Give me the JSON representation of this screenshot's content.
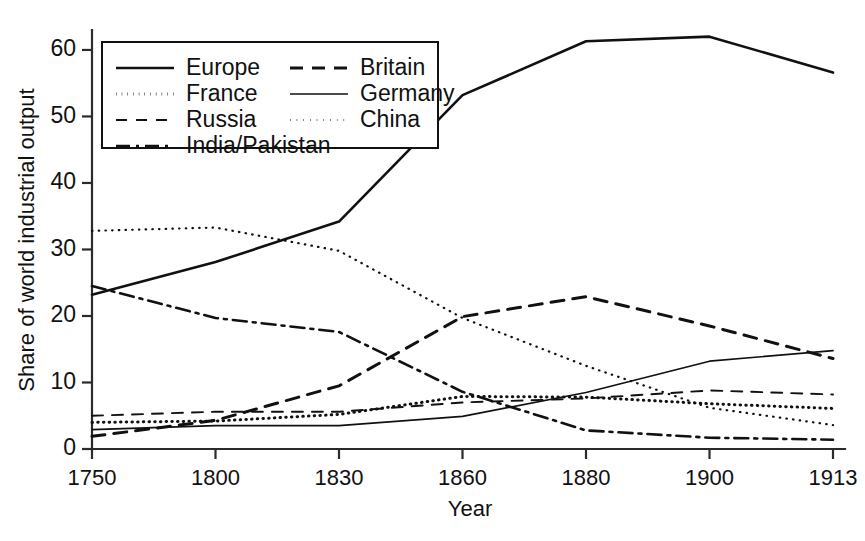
{
  "chart_data": {
    "type": "line",
    "title": "",
    "xlabel": "Year",
    "ylabel": "Share of world industrial output",
    "x": [
      "1750",
      "1800",
      "1830",
      "1860",
      "1880",
      "1900",
      "1913"
    ],
    "categories": [
      "1750",
      "1800",
      "1830",
      "1860",
      "1880",
      "1900",
      "1913"
    ],
    "xtick_labels": [
      "1750",
      "1800",
      "1830",
      "1860",
      "1880",
      "1900",
      "1913"
    ],
    "ytick_labels": [
      "0",
      "10",
      "20",
      "30",
      "40",
      "50",
      "60"
    ],
    "yticks": [
      0,
      10,
      20,
      30,
      40,
      50,
      60
    ],
    "ylim": [
      0,
      63
    ],
    "grid": false,
    "legend_position": "top-left",
    "legend_entries": [
      "Europe",
      "Britain",
      "France",
      "Germany",
      "Russia",
      "China",
      "India/Pakistan"
    ],
    "series": [
      {
        "name": "Europe",
        "style": "solid",
        "values": [
          23.2,
          28.1,
          34.2,
          53.2,
          61.3,
          62.0,
          56.6
        ]
      },
      {
        "name": "Britain",
        "style": "dashed",
        "values": [
          1.9,
          4.3,
          9.5,
          19.9,
          22.9,
          18.5,
          13.6
        ]
      },
      {
        "name": "France",
        "style": "dotted",
        "values": [
          4.0,
          4.2,
          5.2,
          7.9,
          7.8,
          6.8,
          6.1
        ]
      },
      {
        "name": "Germany",
        "style": "solid-thin",
        "values": [
          2.9,
          3.5,
          3.5,
          4.9,
          8.5,
          13.2,
          14.8
        ]
      },
      {
        "name": "Russia",
        "style": "dashed-thin",
        "values": [
          5.0,
          5.6,
          5.6,
          7.0,
          7.6,
          8.8,
          8.2
        ]
      },
      {
        "name": "China",
        "style": "dotted-thin",
        "values": [
          32.8,
          33.3,
          29.8,
          19.7,
          12.5,
          6.2,
          3.6
        ]
      },
      {
        "name": "India/Pakistan",
        "style": "dashdot",
        "values": [
          24.5,
          19.7,
          17.6,
          8.6,
          2.8,
          1.7,
          1.4
        ]
      }
    ]
  },
  "legend": {
    "column_left": [
      {
        "label": "Europe",
        "swatch": "solid"
      },
      {
        "label": "France",
        "swatch": "dotted"
      },
      {
        "label": "Russia",
        "swatch": "dashed-thin"
      },
      {
        "label": "India/Pakistan",
        "swatch": "dashdot"
      }
    ],
    "column_right": [
      {
        "label": "Britain",
        "swatch": "dashed"
      },
      {
        "label": "Germany",
        "swatch": "solid-thin"
      },
      {
        "label": "China",
        "swatch": "dotted-thin"
      }
    ]
  },
  "colors": {
    "ink": "#111111",
    "axis": "#2b2b2b",
    "background": "#ffffff"
  }
}
